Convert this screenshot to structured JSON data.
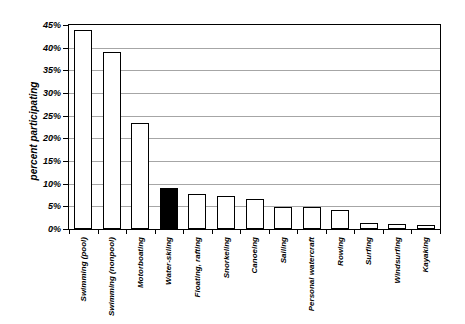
{
  "chart_data": {
    "type": "bar",
    "title": "",
    "xlabel": "",
    "ylabel": "percent participating",
    "ylim": [
      0,
      45
    ],
    "ytick_step": 5,
    "ytick_labels": [
      "0%",
      "5%",
      "10%",
      "15%",
      "20%",
      "25%",
      "30%",
      "35%",
      "40%",
      "45%"
    ],
    "grid": true,
    "legend": "none",
    "categories": [
      "Swimming (pool)",
      "Swimming (nonpool)",
      "Motorboating",
      "Water-skiing",
      "Floating, rafting",
      "Snorkeling",
      "Canoeing",
      "Sailing",
      "Personal watercraft",
      "Rowing",
      "Surfing",
      "Windsurfing",
      "Kayaking"
    ],
    "values": [
      44,
      39,
      23.3,
      9,
      7.7,
      7.2,
      6.6,
      4.9,
      4.8,
      4.3,
      1.4,
      1.1,
      0.9
    ],
    "highlighted_category": "Water-skiing",
    "highlighted_index": 3,
    "colors": {
      "background": "#ffffff",
      "text": "#000000",
      "axis": "#000000",
      "gridline": "#a6a6a6",
      "bar_fill": "#ffffff",
      "bar_fill_highlight": "#000000",
      "bar_border": "#000000"
    }
  }
}
